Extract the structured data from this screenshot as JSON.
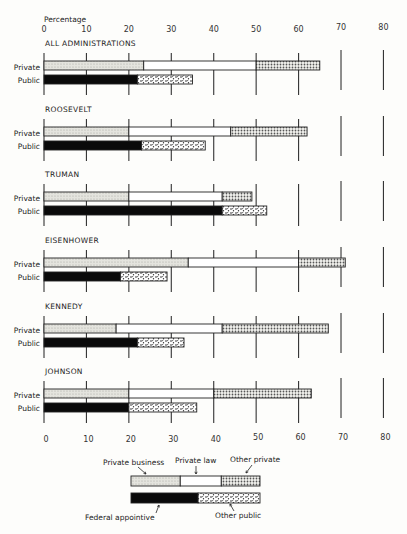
{
  "chart_data": {
    "type": "bar",
    "orientation": "horizontal-stacked",
    "xlabel": "Percentage",
    "xlim": [
      0,
      80
    ],
    "x_ticks": [
      0,
      10,
      20,
      30,
      40,
      50,
      60,
      70,
      80
    ],
    "grid": true,
    "row_labels": {
      "private": "Private",
      "public": "Public"
    },
    "groups": [
      {
        "name": "ALL ADMINISTRATIONS",
        "private": {
          "private_business": 23.5,
          "private_law": 26.5,
          "other_private": 15
        },
        "public": {
          "federal_appointive": 22,
          "other_public": 13
        }
      },
      {
        "name": "ROOSEVELT",
        "private": {
          "private_business": 20,
          "private_law": 24,
          "other_private": 18
        },
        "public": {
          "federal_appointive": 23,
          "other_public": 15
        }
      },
      {
        "name": "TRUMAN",
        "private": {
          "private_business": 20,
          "private_law": 22,
          "other_private": 7
        },
        "public": {
          "federal_appointive": 42,
          "other_public": 10.5
        }
      },
      {
        "name": "EISENHOWER",
        "private": {
          "private_business": 34,
          "private_law": 26,
          "other_private": 11
        },
        "public": {
          "federal_appointive": 18,
          "other_public": 11
        }
      },
      {
        "name": "KENNEDY",
        "private": {
          "private_business": 17,
          "private_law": 25,
          "other_private": 25
        },
        "public": {
          "federal_appointive": 22,
          "other_public": 11
        }
      },
      {
        "name": "JOHNSON",
        "private": {
          "private_business": 20,
          "private_law": 20,
          "other_private": 23
        },
        "public": {
          "federal_appointive": 20,
          "other_public": 16
        }
      }
    ],
    "legend": {
      "placement": "bottom-center",
      "private_business": "Private business",
      "private_law": "Private law",
      "other_private": "Other private",
      "federal_appointive": "Federal appointive",
      "other_public": "Other public"
    },
    "colors": {
      "private_business": "#dcdcd6",
      "private_law": "#ffffff",
      "other_private": "#b8b8b2",
      "federal_appointive": "#0a0a0a",
      "other_public": "#e6e6e0",
      "outline": "#222222"
    }
  }
}
